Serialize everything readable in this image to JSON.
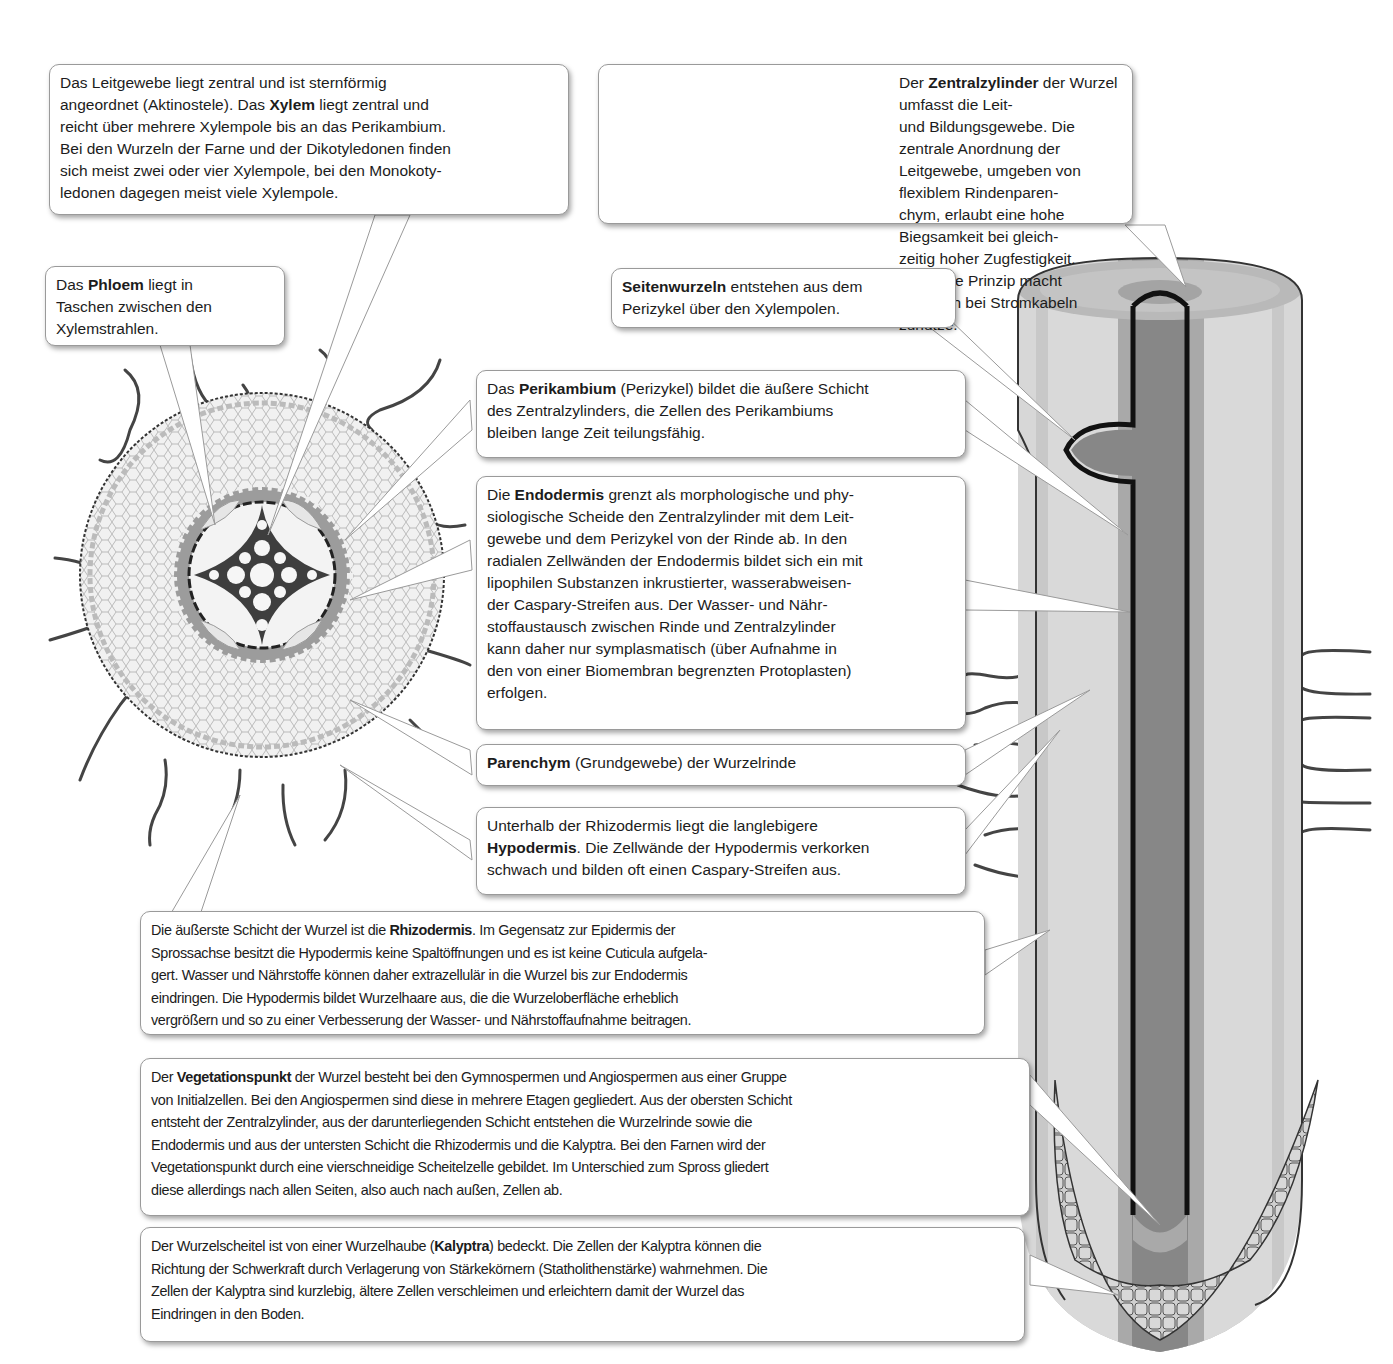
{
  "figure": {
    "title": "",
    "type": "labeled-diagram",
    "colors": {
      "background": "#ffffff",
      "box_border": "#9a9a9a",
      "root_outer_cortex": "#d4d4d4",
      "root_cortex_band": "#bdbdbd",
      "root_pericycle": "#a8a8a8",
      "central_cylinder": "#8a8a8a",
      "endodermis_line": "#111111",
      "cap_cells": "#c8c8c8"
    }
  },
  "illustrations": {
    "cross_section": {
      "name": "Wurzelquerschnitt",
      "xylem_poles": 4
    },
    "longitudinal_section": {
      "name": "Wurzellängsschnitt mit Seitenwurzelanlage und Kalyptra"
    },
    "cable_photo": {
      "name": "Koaxialkabel (Stromkabel) Foto"
    }
  },
  "labels": {
    "leitgewebe": {
      "parts": [
        {
          "t": "Das Leitgewebe liegt zentral und ist sternförmig\nangeordnet (Aktinostele). Das ",
          "b": false
        },
        {
          "t": "Xylem",
          "b": true
        },
        {
          "t": " liegt zentral und\nreicht über mehrere Xylempole bis an das Perikambium.\nBei den Wurzeln der Farne und der Dikotyledonen finden\nsich meist zwei oder vier Xylempole, bei den Monokoty-\nledonen dagegen meist viele Xylempole.",
          "b": false
        }
      ]
    },
    "zentralzylinder": {
      "parts": [
        {
          "t": "Der ",
          "b": false
        },
        {
          "t": "Zentralzylinder",
          "b": true
        },
        {
          "t": " der Wurzel umfasst die Leit-\nund Bildungsgewebe. Die zentrale Anordnung der\nLeitgewebe, umgeben von flexiblem Rindenparen-\nchym, erlaubt eine hohe Biegsamkeit bei gleich-\nzeitig hoher Zugfestigkeit. Dasselbe Prinzip macht\nman sich bei Stromkabeln zunutze.",
          "b": false
        }
      ]
    },
    "phloem": {
      "parts": [
        {
          "t": "Das ",
          "b": false
        },
        {
          "t": "Phloem",
          "b": true
        },
        {
          "t": " liegt in\nTaschen zwischen den\nXylemstrahlen.",
          "b": false
        }
      ]
    },
    "seitenwurzeln": {
      "parts": [
        {
          "t": "Seitenwurzeln",
          "b": true
        },
        {
          "t": " entstehen aus dem\nPerizykel über den Xylempolen.",
          "b": false
        }
      ]
    },
    "perikambium": {
      "parts": [
        {
          "t": "Das ",
          "b": false
        },
        {
          "t": "Perikambium",
          "b": true
        },
        {
          "t": " (Perizykel) bildet die äußere Schicht\ndes Zentralzylinders, die Zellen des Perikambiums\nbleiben lange Zeit teilungsfähig.",
          "b": false
        }
      ]
    },
    "endodermis": {
      "parts": [
        {
          "t": "Die ",
          "b": false
        },
        {
          "t": "Endodermis",
          "b": true
        },
        {
          "t": " grenzt als morphologische und phy-\nsiologische Scheide den Zentralzylinder mit dem Leit-\ngewebe und dem Perizykel von der Rinde ab. In den\nradialen Zellwänden der Endodermis bildet sich ein mit\nlipophilen Substanzen inkrustierter, wasserabweisen-\nder Caspary-Streifen aus. Der Wasser- und Nähr-\nstoffaustausch zwischen Rinde und Zentralzylinder\nkann daher nur symplasmatisch (über Aufnahme in\nden von einer Biomembran begrenzten Protoplasten)\nerfolgen.",
          "b": false
        }
      ]
    },
    "parenchym": {
      "parts": [
        {
          "t": "Parenchym",
          "b": true
        },
        {
          "t": " (Grundgewebe) der Wurzelrinde",
          "b": false
        }
      ]
    },
    "hypodermis": {
      "parts": [
        {
          "t": "Unterhalb der Rhizodermis liegt die langlebigere\n",
          "b": false
        },
        {
          "t": "Hypodermis",
          "b": true
        },
        {
          "t": ". Die Zellwände der Hypodermis verkorken\nschwach und bilden oft einen Caspary-Streifen aus.",
          "b": false
        }
      ]
    },
    "rhizodermis": {
      "parts": [
        {
          "t": "Die äußerste Schicht der Wurzel ist die ",
          "b": false
        },
        {
          "t": "Rhizodermis",
          "b": true
        },
        {
          "t": ". Im Gegensatz zur Epidermis der\nSprossachse besitzt die Hypodermis keine Spaltöffnungen und es ist keine Cuticula aufgela-\ngert. Wasser und Nährstoffe können daher extrazellulär in die Wurzel bis zur Endodermis\neindringen. Die Hypodermis bildet Wurzelhaare aus, die die Wurzeloberfläche erheblich\nvergrößern und so zu einer Verbesserung der Wasser- und Nährstoffaufnahme beitragen.",
          "b": false
        }
      ]
    },
    "vegetationspunkt": {
      "parts": [
        {
          "t": "Der ",
          "b": false
        },
        {
          "t": "Vegetationspunkt",
          "b": true
        },
        {
          "t": " der Wurzel besteht bei den Gymnospermen und Angiospermen aus einer Gruppe\nvon Initialzellen. Bei den Angiospermen sind diese in mehrere Etagen gegliedert. Aus der obersten Schicht\nentsteht der Zentralzylinder, aus der darunterliegenden Schicht entstehen die Wurzelrinde sowie die\nEndodermis und aus der untersten Schicht die Rhizodermis und die Kalyptra. Bei den Farnen wird der\nVegetationspunkt durch eine vierschneidige Scheitelzelle gebildet. Im Unterschied zum Spross gliedert\ndiese allerdings nach allen Seiten, also auch nach außen, Zellen ab.",
          "b": false
        }
      ]
    },
    "kalyptra": {
      "parts": [
        {
          "t": "Der Wurzelscheitel ist von einer Wurzelhaube (",
          "b": false
        },
        {
          "t": "Kalyptra",
          "b": true
        },
        {
          "t": ") bedeckt. Die Zellen der Kalyptra können die\nRichtung der Schwerkraft durch Verlagerung von Stärkekörnern (Statholithenstärke) wahrnehmen. Die\nZellen der Kalyptra sind kurzlebig, ältere Zellen verschleimen und erleichtern damit der Wurzel das\nEindringen in den Boden.",
          "b": false
        }
      ]
    }
  }
}
